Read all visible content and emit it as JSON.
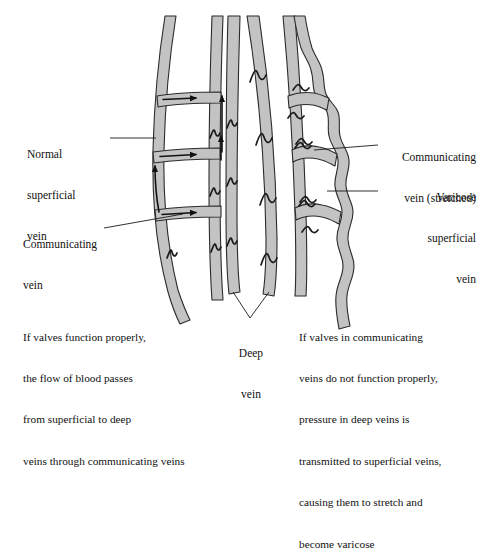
{
  "figure": {
    "kind": "medical-illustration",
    "colors": {
      "vein_fill": "#c3c3c3",
      "vein_outline": "#2b2b2b",
      "background": "#ffffff",
      "text": "#111111",
      "leader_line": "#1a1a1a"
    }
  },
  "labels": {
    "normal_superficial_vein": {
      "line1": "Normal",
      "line2": "superficial",
      "line3": "vein"
    },
    "communicating_vein": {
      "line1": "Communicating",
      "line2": "vein"
    },
    "communicating_vein_stretched": {
      "line1": "Communicating",
      "line2": "vein (stretched)"
    },
    "varicose_superficial_vein": {
      "line1": "Varicose",
      "line2": "superficial",
      "line3": "vein"
    },
    "deep_vein": {
      "line1": "Deep",
      "line2": "vein"
    }
  },
  "captions": {
    "left": {
      "line1": "If valves function properly,",
      "line2": "the flow of blood passes",
      "line3": "from superficial to deep",
      "line4": "veins through communicating veins"
    },
    "right": {
      "line1": "If valves in communicating",
      "line2": "veins do not function properly,",
      "line3": "pressure in deep veins is",
      "line4": "transmitted to superficial veins,",
      "line5": "causing them to stretch and",
      "line6": "become varicose"
    }
  }
}
